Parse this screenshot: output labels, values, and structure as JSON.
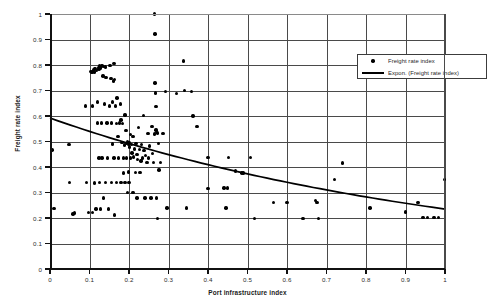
{
  "chart_data": {
    "type": "scatter",
    "title": "",
    "xlabel": "Port infrastructure index",
    "ylabel": "Freight rate index",
    "xlim": [
      0,
      1
    ],
    "ylim": [
      0,
      1
    ],
    "xticks": [
      "0",
      "0.1",
      "0.2",
      "0.3",
      "0.4",
      "0.5",
      "0.6",
      "0.7",
      "0.8",
      "0.9",
      "1"
    ],
    "yticks": [
      "0",
      "0.1",
      "0.2",
      "0.3",
      "0.4",
      "0.5",
      "0.6",
      "0.7",
      "0.8",
      "0.9",
      "1"
    ],
    "grid": true,
    "legend_position": "top-right",
    "legend": [
      {
        "label": "Freight rate index",
        "marker": "diamond",
        "key": "marker"
      },
      {
        "label": "Expon. (Freight rate index)",
        "marker": "line",
        "key": "line"
      }
    ],
    "series": [
      {
        "name": "Freight rate index",
        "marker_color": "#000000",
        "points": [
          [
            0.005,
            0.466
          ],
          [
            0.01,
            0.238
          ],
          [
            0.048,
            0.488
          ],
          [
            0.05,
            0.339
          ],
          [
            0.058,
            0.215
          ],
          [
            0.062,
            0.22
          ],
          [
            0.09,
            0.639
          ],
          [
            0.092,
            0.339
          ],
          [
            0.098,
            0.222
          ],
          [
            0.104,
            0.775
          ],
          [
            0.106,
            0.77
          ],
          [
            0.108,
            0.64
          ],
          [
            0.108,
            0.222
          ],
          [
            0.11,
            0.781
          ],
          [
            0.112,
            0.773
          ],
          [
            0.112,
            0.338
          ],
          [
            0.114,
            0.786
          ],
          [
            0.116,
            0.236
          ],
          [
            0.118,
            0.779
          ],
          [
            0.12,
            0.655
          ],
          [
            0.12,
            0.572
          ],
          [
            0.122,
            0.79
          ],
          [
            0.124,
            0.784
          ],
          [
            0.124,
            0.436
          ],
          [
            0.126,
            0.796
          ],
          [
            0.126,
            0.339
          ],
          [
            0.128,
            0.788
          ],
          [
            0.128,
            0.236
          ],
          [
            0.13,
            0.793
          ],
          [
            0.13,
            0.572
          ],
          [
            0.132,
            0.797
          ],
          [
            0.132,
            0.436
          ],
          [
            0.134,
            0.757
          ],
          [
            0.136,
            0.793
          ],
          [
            0.136,
            0.278
          ],
          [
            0.138,
            0.647
          ],
          [
            0.14,
            0.792
          ],
          [
            0.14,
            0.339
          ],
          [
            0.142,
            0.752
          ],
          [
            0.144,
            0.572
          ],
          [
            0.146,
            0.436
          ],
          [
            0.148,
            0.236
          ],
          [
            0.15,
            0.64
          ],
          [
            0.152,
            0.798
          ],
          [
            0.154,
            0.746
          ],
          [
            0.156,
            0.572
          ],
          [
            0.156,
            0.339
          ],
          [
            0.158,
            0.655
          ],
          [
            0.158,
            0.49
          ],
          [
            0.16,
            0.737
          ],
          [
            0.162,
            0.805
          ],
          [
            0.162,
            0.436
          ],
          [
            0.164,
            0.744
          ],
          [
            0.164,
            0.212
          ],
          [
            0.166,
            0.64
          ],
          [
            0.168,
            0.571
          ],
          [
            0.168,
            0.339
          ],
          [
            0.17,
            0.67
          ],
          [
            0.172,
            0.52
          ],
          [
            0.174,
            0.436
          ],
          [
            0.176,
            0.572
          ],
          [
            0.178,
            0.647
          ],
          [
            0.18,
            0.585
          ],
          [
            0.18,
            0.339
          ],
          [
            0.182,
            0.497
          ],
          [
            0.184,
            0.57
          ],
          [
            0.186,
            0.436
          ],
          [
            0.186,
            0.376
          ],
          [
            0.188,
            0.487
          ],
          [
            0.19,
            0.604
          ],
          [
            0.19,
            0.339
          ],
          [
            0.192,
            0.544
          ],
          [
            0.194,
            0.491
          ],
          [
            0.194,
            0.436
          ],
          [
            0.196,
            0.5
          ],
          [
            0.196,
            0.299
          ],
          [
            0.198,
            0.488
          ],
          [
            0.198,
            0.38
          ],
          [
            0.2,
            0.497
          ],
          [
            0.2,
            0.339
          ],
          [
            0.202,
            0.478
          ],
          [
            0.204,
            0.528
          ],
          [
            0.204,
            0.436
          ],
          [
            0.206,
            0.489
          ],
          [
            0.208,
            0.455
          ],
          [
            0.21,
            0.519
          ],
          [
            0.21,
            0.299
          ],
          [
            0.212,
            0.44
          ],
          [
            0.214,
            0.47
          ],
          [
            0.216,
            0.378
          ],
          [
            0.218,
            0.491
          ],
          [
            0.22,
            0.448
          ],
          [
            0.22,
            0.278
          ],
          [
            0.222,
            0.429
          ],
          [
            0.224,
            0.555
          ],
          [
            0.226,
            0.469
          ],
          [
            0.228,
            0.378
          ],
          [
            0.23,
            0.424
          ],
          [
            0.232,
            0.488
          ],
          [
            0.234,
            0.435
          ],
          [
            0.236,
            0.601
          ],
          [
            0.238,
            0.464
          ],
          [
            0.24,
            0.278
          ],
          [
            0.242,
            0.446
          ],
          [
            0.246,
            0.418
          ],
          [
            0.248,
            0.532
          ],
          [
            0.25,
            0.435
          ],
          [
            0.252,
            0.482
          ],
          [
            0.256,
            0.278
          ],
          [
            0.258,
            0.56
          ],
          [
            0.26,
            0.453
          ],
          [
            0.262,
            0.418
          ],
          [
            0.264,
            0.53
          ],
          [
            0.265,
            1.0
          ],
          [
            0.266,
            0.729
          ],
          [
            0.266,
            0.922
          ],
          [
            0.267,
            0.69
          ],
          [
            0.268,
            0.637
          ],
          [
            0.268,
            0.545
          ],
          [
            0.27,
            0.535
          ],
          [
            0.27,
            0.278
          ],
          [
            0.272,
            0.533
          ],
          [
            0.272,
            0.199
          ],
          [
            0.274,
            0.493
          ],
          [
            0.276,
            0.388
          ],
          [
            0.28,
            0.418
          ],
          [
            0.286,
            0.532
          ],
          [
            0.292,
            0.696
          ],
          [
            0.296,
            0.239
          ],
          [
            0.32,
            0.688
          ],
          [
            0.338,
            0.815
          ],
          [
            0.34,
            0.7
          ],
          [
            0.345,
            0.239
          ],
          [
            0.358,
            0.697
          ],
          [
            0.362,
            0.6
          ],
          [
            0.372,
            0.56
          ],
          [
            0.398,
            0.316
          ],
          [
            0.4,
            0.437
          ],
          [
            0.402,
            0.316
          ],
          [
            0.44,
            0.317
          ],
          [
            0.446,
            0.239
          ],
          [
            0.45,
            0.317
          ],
          [
            0.452,
            0.437
          ],
          [
            0.47,
            0.384
          ],
          [
            0.486,
            0.377
          ],
          [
            0.49,
            0.377
          ],
          [
            0.508,
            0.437
          ],
          [
            0.518,
            0.199
          ],
          [
            0.566,
            0.261
          ],
          [
            0.6,
            0.261
          ],
          [
            0.64,
            0.199
          ],
          [
            0.672,
            0.268
          ],
          [
            0.676,
            0.262
          ],
          [
            0.68,
            0.199
          ],
          [
            0.72,
            0.35
          ],
          [
            0.74,
            0.416
          ],
          [
            0.81,
            0.239
          ],
          [
            0.9,
            0.223
          ],
          [
            0.932,
            0.26
          ],
          [
            0.944,
            0.203
          ],
          [
            0.956,
            0.203
          ],
          [
            0.972,
            0.203
          ],
          [
            0.984,
            0.203
          ],
          [
            0.998,
            0.351
          ]
        ]
      }
    ],
    "trendline": {
      "name": "Expon. (Freight rate index)",
      "type": "exponential",
      "color": "#000000",
      "y_at_x0": 0.592,
      "y_at_x1": 0.235
    }
  }
}
